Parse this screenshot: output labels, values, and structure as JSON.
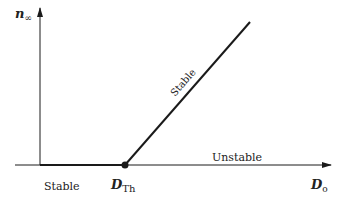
{
  "diagram": {
    "y_axis_label": {
      "main": "n",
      "sub": "∞"
    },
    "x_axis_label": {
      "main": "D",
      "sub": "o"
    },
    "threshold_label": {
      "main": "D",
      "sub": "Th"
    },
    "labels": {
      "stable_low": "Stable",
      "stable_branch": "Stable",
      "unstable_branch": "Unstable"
    },
    "colors": {
      "line": "#1a1a1a",
      "text": "#222222",
      "background": "#ffffff"
    }
  }
}
